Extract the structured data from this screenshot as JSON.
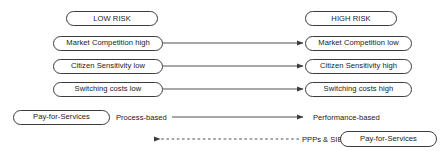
{
  "diagram": {
    "stroke_color": "#3c3c3c",
    "text_color": "#1a1a1a",
    "background": "#ffffff",
    "columns": {
      "left_header": "LOW RISK",
      "right_header": "HIGH RISK"
    },
    "rows": [
      {
        "left": "Market Competition high",
        "right": "Market Competition low"
      },
      {
        "left": "Citizen Sensitivity low",
        "right": "Citizen Sensitivity high"
      },
      {
        "left": "Switching costs low",
        "right": "Switching costs high"
      }
    ],
    "bottom": {
      "left_pill": "Pay-for-Services",
      "left_label": "Process-based",
      "right_label": "Performance-based",
      "return_label": "PPPs & SIBs",
      "right_pill": "Pay-for-Services"
    },
    "arrows": {
      "solid_style": "solid",
      "dashed_style": "dashed",
      "solid_direction": "right",
      "dashed_direction": "left"
    }
  }
}
